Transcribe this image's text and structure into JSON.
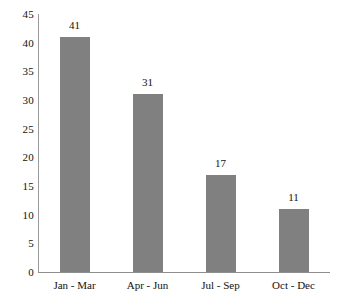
{
  "chart_data": {
    "type": "bar",
    "title": "",
    "subtitle": "",
    "xlabel": "",
    "ylabel": "",
    "categories": [
      "Jan - Mar",
      "Apr - Jun",
      "Jul - Sep",
      "Oct - Dec"
    ],
    "values": [
      41,
      31,
      17,
      11
    ],
    "data_labels": [
      "41",
      "31",
      "17",
      "11"
    ],
    "series": [
      {
        "name": "",
        "values": [
          41,
          31,
          17,
          11
        ]
      }
    ],
    "ylim": [
      0,
      45
    ],
    "yticks": [
      45,
      40,
      35,
      30,
      25,
      20,
      15,
      10,
      5,
      0
    ],
    "ytick_labels": [
      "45",
      "40",
      "35",
      "30",
      "25",
      "20",
      "15",
      "10",
      "5",
      "0"
    ],
    "grid": false,
    "legend": false,
    "legend_position": "none",
    "bar_color": "#808080",
    "axis_color": "#8f8f8f",
    "background_color": "#ffffff",
    "text_color": "#111111"
  }
}
